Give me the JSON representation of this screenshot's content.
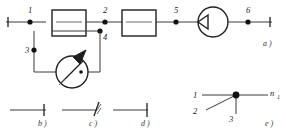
{
  "figure": {
    "colors": {
      "line": "#3a3a3a",
      "line_bold": "#1f1f1f",
      "node": "#111111",
      "background": "#ffffff",
      "label": "#1a1a1a"
    }
  },
  "panel_a": {
    "caption": "a )",
    "nodes": [
      {
        "id": "n1",
        "label": "1"
      },
      {
        "id": "n2",
        "label": "2"
      },
      {
        "id": "n3",
        "label": "3"
      },
      {
        "id": "n4",
        "label": "4"
      },
      {
        "id": "n5",
        "label": "5"
      },
      {
        "id": "n6",
        "label": "6"
      }
    ],
    "blocks": [
      {
        "id": "block-1",
        "label": ""
      },
      {
        "id": "block-2",
        "label": ""
      }
    ],
    "meter": {
      "label": "",
      "type": "instrument-circle-arrow"
    },
    "source": {
      "label": "",
      "type": "circle-with-arrowhead"
    }
  },
  "panel_b": {
    "caption": "b )",
    "symbol": "terminal-cross"
  },
  "panel_c": {
    "caption": "c )",
    "symbol": "terminal-break"
  },
  "panel_d": {
    "caption": "d )",
    "symbol": "terminal-bar"
  },
  "panel_e": {
    "caption": "e )",
    "branch_labels": [
      {
        "id": "e1",
        "label": "1"
      },
      {
        "id": "e2",
        "label": "2"
      },
      {
        "id": "e3",
        "label": "3"
      }
    ],
    "node_label": {
      "base": "n",
      "sub": "1"
    }
  }
}
